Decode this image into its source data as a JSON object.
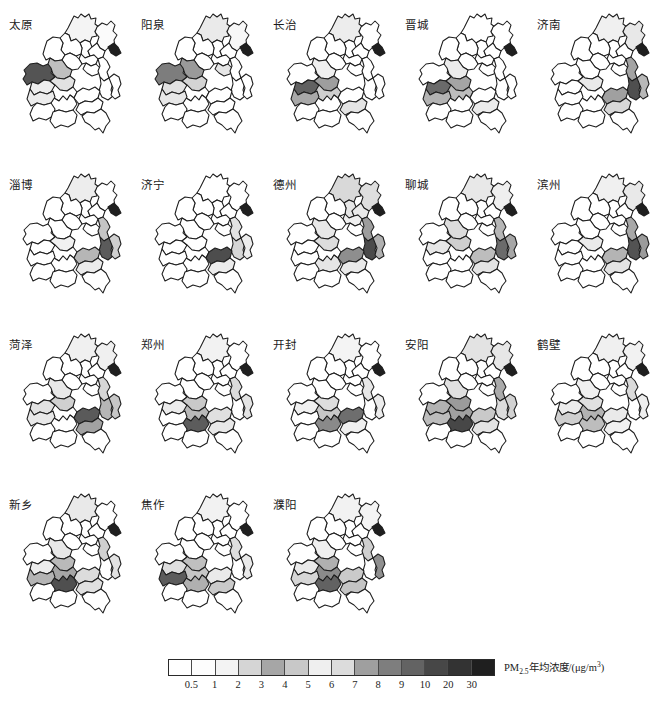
{
  "figure": {
    "kind": "small-multiples-choropleth-map-grid",
    "rows": 4,
    "columns": 5,
    "panel_count": 18
  },
  "panels": [
    {
      "title": "太原",
      "fills": [
        "#f4f4f4",
        "#fbfbfb",
        "#ffffff",
        "#ffffff",
        "#ffffff",
        "#ffffff",
        "#ffffff",
        "#ffffff",
        "#545454",
        "#bfbfbf",
        "#ffffff",
        "#ffffff",
        "#ffffff",
        "#ffffff",
        "#1f1f1f",
        "#ededed",
        "#e2e2e2",
        "#ffffff",
        "#ffffff",
        "#ffffff",
        "#ececec",
        "#ffffff",
        "#ffffff",
        "#ffffff",
        "#ffffff"
      ]
    },
    {
      "title": "阳泉",
      "fills": [
        "#eaeaea",
        "#f7f7f7",
        "#ffffff",
        "#ffffff",
        "#ffffff",
        "#ffffff",
        "#ffffff",
        "#ffffff",
        "#7d7d7d",
        "#9a9a9a",
        "#e6e6e6",
        "#ffffff",
        "#ffffff",
        "#ffffff",
        "#1f1f1f",
        "#e2e2e2",
        "#d4d4d4",
        "#ffffff",
        "#ffffff",
        "#ffffff",
        "#e7e7e7",
        "#ffffff",
        "#ffffff",
        "#ffffff",
        "#ffffff"
      ]
    },
    {
      "title": "长治",
      "fills": [
        "#ededed",
        "#ffffff",
        "#ffffff",
        "#ffffff",
        "#ffffff",
        "#ffffff",
        "#ffffff",
        "#ffffff",
        "#ffffff",
        "#efefef",
        "#ffffff",
        "#ffffff",
        "#ffffff",
        "#ffffff",
        "#1f1f1f",
        "#616161",
        "#9e9e9e",
        "#cfcfcf",
        "#ffffff",
        "#ffffff",
        "#a8a8a8",
        "#e4e4e4",
        "#ffffff",
        "#ffffff",
        "#ffffff"
      ]
    },
    {
      "title": "晋城",
      "fills": [
        "#ffffff",
        "#ffffff",
        "#ffffff",
        "#ffffff",
        "#ffffff",
        "#ffffff",
        "#ffffff",
        "#ffffff",
        "#ffffff",
        "#ebebeb",
        "#ffffff",
        "#ffffff",
        "#ffffff",
        "#ffffff",
        "#1f1f1f",
        "#6a6a6a",
        "#a5a5a5",
        "#bdbdbd",
        "#ffffff",
        "#ffffff",
        "#b3b3b3",
        "#ebebeb",
        "#ffffff",
        "#ffffff",
        "#ffffff"
      ]
    },
    {
      "title": "济南",
      "fills": [
        "#f0f0f0",
        "#e8e8e8",
        "#ffffff",
        "#ffffff",
        "#ffffff",
        "#ffffff",
        "#ffffff",
        "#ffffff",
        "#ffffff",
        "#ffffff",
        "#ffffff",
        "#a3a3a3",
        "#4f4f4f",
        "#b8b8b8",
        "#1f1f1f",
        "#ffffff",
        "#e9e9e9",
        "#ffffff",
        "#ffffff",
        "#a0a0a0",
        "#ffffff",
        "#d8d8d8",
        "#ffffff",
        "#ffffff",
        "#ffffff"
      ]
    },
    {
      "title": "淄博",
      "fills": [
        "#ededed",
        "#ffffff",
        "#ffffff",
        "#ffffff",
        "#ffffff",
        "#ffffff",
        "#ffffff",
        "#ffffff",
        "#ffffff",
        "#ffffff",
        "#ffffff",
        "#c4c4c4",
        "#5b5b5b",
        "#cfcfcf",
        "#1f1f1f",
        "#ffffff",
        "#f1f1f1",
        "#ffffff",
        "#ffffff",
        "#b6b6b6",
        "#ffffff",
        "#ebebeb",
        "#ffffff",
        "#ffffff",
        "#ffffff"
      ]
    },
    {
      "title": "济宁",
      "fills": [
        "#ffffff",
        "#ffffff",
        "#ffffff",
        "#ffffff",
        "#ffffff",
        "#ffffff",
        "#ffffff",
        "#ffffff",
        "#ffffff",
        "#ffffff",
        "#ffffff",
        "#e3e3e3",
        "#d6d6d6",
        "#ededed",
        "#1f1f1f",
        "#ffffff",
        "#ffffff",
        "#ffffff",
        "#ffffff",
        "#4d4d4d",
        "#ffffff",
        "#ececec",
        "#ffffff",
        "#ffffff",
        "#ffffff"
      ]
    },
    {
      "title": "德州",
      "fills": [
        "#d9d9d9",
        "#dedede",
        "#e6e6e6",
        "#eaeaea",
        "#ffffff",
        "#f0f0f0",
        "#ffffff",
        "#ffffff",
        "#ffffff",
        "#e8e8e8",
        "#ffffff",
        "#9d9d9d",
        "#4a4a4a",
        "#b0b0b0",
        "#1f1f1f",
        "#ffffff",
        "#dcdcdc",
        "#ffffff",
        "#e6e6e6",
        "#8e8e8e",
        "#ffffff",
        "#e9e9e9",
        "#ffffff",
        "#ffffff",
        "#ffffff"
      ]
    },
    {
      "title": "聊城",
      "fills": [
        "#e8e8e8",
        "#efefef",
        "#ffffff",
        "#ffffff",
        "#ffffff",
        "#ffffff",
        "#ffffff",
        "#ffffff",
        "#ffffff",
        "#dcdcdc",
        "#ffffff",
        "#b6b6b6",
        "#6b6b6b",
        "#a6a6a6",
        "#1f1f1f",
        "#e7e7e7",
        "#cfcfcf",
        "#ffffff",
        "#ffffff",
        "#bdbdbd",
        "#ffffff",
        "#e4e4e4",
        "#ffffff",
        "#ffffff",
        "#ffffff"
      ]
    },
    {
      "title": "滨州",
      "fills": [
        "#f0f0f0",
        "#e9e9e9",
        "#ffffff",
        "#ffffff",
        "#ffffff",
        "#ffffff",
        "#ffffff",
        "#ffffff",
        "#ffffff",
        "#ffffff",
        "#ffffff",
        "#a8a8a8",
        "#535353",
        "#9b9b9b",
        "#1f1f1f",
        "#ffffff",
        "#eaeaea",
        "#ffffff",
        "#ffffff",
        "#b4b4b4",
        "#ffffff",
        "#e3e3e3",
        "#ffffff",
        "#ffffff",
        "#ffffff"
      ]
    },
    {
      "title": "菏泽",
      "fills": [
        "#f0f0f0",
        "#f0f0f0",
        "#ffffff",
        "#ffffff",
        "#ffffff",
        "#ffffff",
        "#ffffff",
        "#ffffff",
        "#ffffff",
        "#e8e8e8",
        "#ffffff",
        "#d6d6d6",
        "#b6b6b6",
        "#c6c6c6",
        "#1f1f1f",
        "#e2e2e2",
        "#d0d0d0",
        "#ffffff",
        "#ffffff",
        "#5a5a5a",
        "#e8e8e8",
        "#a2a2a2",
        "#ffffff",
        "#ffffff",
        "#ffffff"
      ]
    },
    {
      "title": "郑州",
      "fills": [
        "#f2f2f2",
        "#ffffff",
        "#ffffff",
        "#ffffff",
        "#ffffff",
        "#ffffff",
        "#ffffff",
        "#ffffff",
        "#ffffff",
        "#ffffff",
        "#ffffff",
        "#dcdcdc",
        "#ffffff",
        "#e4e4e4",
        "#1f1f1f",
        "#ececec",
        "#c9c9c9",
        "#b9b9b9",
        "#5c5c5c",
        "#e0e0e0",
        "#ffffff",
        "#e8e8e8",
        "#ffffff",
        "#ffffff",
        "#ffffff"
      ]
    },
    {
      "title": "开封",
      "fills": [
        "#f4f4f4",
        "#ffffff",
        "#ffffff",
        "#ffffff",
        "#ffffff",
        "#ffffff",
        "#ffffff",
        "#ffffff",
        "#ffffff",
        "#ffffff",
        "#ffffff",
        "#e7e7e7",
        "#ffffff",
        "#ececec",
        "#1f1f1f",
        "#f0f0f0",
        "#dddddd",
        "#c8c8c8",
        "#8a8a8a",
        "#6e6e6e",
        "#ffffff",
        "#efefef",
        "#ffffff",
        "#ffffff",
        "#ffffff"
      ]
    },
    {
      "title": "安阳",
      "fills": [
        "#e3e3e3",
        "#e7e7e7",
        "#ffffff",
        "#ffffff",
        "#ffffff",
        "#ffffff",
        "#ffffff",
        "#ffffff",
        "#ffffff",
        "#e0e0e0",
        "#ffffff",
        "#ababab",
        "#dcdcdc",
        "#d2d2d2",
        "#1f1f1f",
        "#b2b2b2",
        "#9b9b9b",
        "#a0a0a0",
        "#474747",
        "#c9c9c9",
        "#bcbcbc",
        "#e4e4e4",
        "#ffffff",
        "#ffffff",
        "#ffffff"
      ]
    },
    {
      "title": "鹤壁",
      "fills": [
        "#f0f0f0",
        "#f2f2f2",
        "#ffffff",
        "#ffffff",
        "#ffffff",
        "#ffffff",
        "#ffffff",
        "#ffffff",
        "#ffffff",
        "#f0f0f0",
        "#ffffff",
        "#dbdbdb",
        "#ffffff",
        "#eeeeee",
        "#1f1f1f",
        "#ececec",
        "#e0e0e0",
        "#b3b3b3",
        "#bdbdbd",
        "#eaeaea",
        "#cfcfcf",
        "#f0f0f0",
        "#ffffff",
        "#ffffff",
        "#ffffff"
      ]
    },
    {
      "title": "新乡",
      "fills": [
        "#e9e9e9",
        "#ffffff",
        "#ffffff",
        "#ffffff",
        "#ffffff",
        "#ffffff",
        "#ffffff",
        "#ffffff",
        "#ffffff",
        "#e8e8e8",
        "#ffffff",
        "#d0d0d0",
        "#ffffff",
        "#e2e2e2",
        "#1f1f1f",
        "#ededed",
        "#bababa",
        "#a6a6a6",
        "#4f4f4f",
        "#dcdcdc",
        "#b4b4b4",
        "#e0e0e0",
        "#ffffff",
        "#ffffff",
        "#ffffff"
      ]
    },
    {
      "title": "焦作",
      "fills": [
        "#f2f2f2",
        "#ffffff",
        "#ffffff",
        "#ffffff",
        "#ffffff",
        "#ffffff",
        "#ffffff",
        "#ffffff",
        "#ffffff",
        "#ffffff",
        "#ffffff",
        "#dddddd",
        "#ffffff",
        "#eaeaea",
        "#1f1f1f",
        "#dfdfdf",
        "#c0c0c0",
        "#c6c6c6",
        "#b0b0b0",
        "#eaeaea",
        "#5c5c5c",
        "#cacaca",
        "#ffffff",
        "#ffffff",
        "#ffffff"
      ]
    },
    {
      "title": "濮阳",
      "fills": [
        "#f2f2f2",
        "#f4f4f4",
        "#ffffff",
        "#ffffff",
        "#ffffff",
        "#ffffff",
        "#ffffff",
        "#ffffff",
        "#ffffff",
        "#efefef",
        "#ffffff",
        "#cfcfcf",
        "#ffffff",
        "#8f8f8f",
        "#1f1f1f",
        "#eaeaea",
        "#b0b0b0",
        "#8b8b8b",
        "#626262",
        "#cacaca",
        "#d6d6d6",
        "#c4c4c4",
        "#ffffff",
        "#ffffff",
        "#ffffff"
      ]
    }
  ],
  "legend": {
    "label": "PM",
    "label_sub": "2.5",
    "label_rest": "年均浓度/(μg/m",
    "label_sup": "3",
    "label_end": ")",
    "swatch_color": "#1f1f1f",
    "ticks": [
      "0.5",
      "1",
      "2",
      "3",
      "4",
      "5",
      "6",
      "7",
      "8",
      "9",
      "10",
      "20",
      "30"
    ],
    "cells": [
      "#ffffff",
      "#fdfdfd",
      "#f3f3f3",
      "#d5d5d5",
      "#a6a6a6",
      "#c8c8c8",
      "#efefef",
      "#dcdcdc",
      "#9f9f9f",
      "#7e7e7e",
      "#636363",
      "#474747",
      "#333333",
      "#1f1f1f"
    ]
  },
  "chart_data": {
    "type": "heatmap",
    "title": "",
    "xlabel": "",
    "ylabel": "",
    "legend_title": "PM2.5年均浓度/(μg/m³)",
    "legend_breaks": [
      0.5,
      1,
      2,
      3,
      4,
      5,
      6,
      7,
      8,
      9,
      10,
      20,
      30
    ],
    "panel_titles": [
      "太原",
      "阳泉",
      "长治",
      "晋城",
      "济南",
      "淄博",
      "济宁",
      "德州",
      "聊城",
      "滨州",
      "菏泽",
      "郑州",
      "开封",
      "安阳",
      "鹤壁",
      "新乡",
      "焦作",
      "濮阳"
    ],
    "region_count_per_panel": 25,
    "series": [
      {
        "name": "太原",
        "values": [
          1.1,
          0.7,
          0.2,
          0.2,
          0.2,
          0.2,
          0.2,
          0.2,
          20,
          6,
          0.2,
          0.2,
          0.2,
          0.2,
          35,
          1.5,
          2.2,
          0.2,
          0.2,
          0.2,
          1.6,
          0.2,
          0.2,
          0.2,
          0.2
        ]
      },
      {
        "name": "阳泉",
        "values": [
          1.8,
          0.9,
          0.2,
          0.2,
          0.2,
          0.2,
          0.2,
          0.2,
          9,
          8,
          2.0,
          0.2,
          0.2,
          0.2,
          35,
          2.2,
          3.0,
          0.2,
          0.2,
          0.2,
          1.9,
          0.2,
          0.2,
          0.2,
          0.2
        ]
      },
      {
        "name": "长治",
        "values": [
          1.5,
          0.2,
          0.2,
          0.2,
          0.2,
          0.2,
          0.2,
          0.2,
          0.2,
          1.3,
          0.2,
          0.2,
          0.2,
          0.2,
          35,
          20,
          8,
          4.5,
          0.2,
          0.2,
          7,
          2.0,
          0.2,
          0.2,
          0.2
        ]
      },
      {
        "name": "晋城",
        "values": [
          0.2,
          0.2,
          0.2,
          0.2,
          0.2,
          0.2,
          0.2,
          0.2,
          0.2,
          1.4,
          0.2,
          0.2,
          0.2,
          0.2,
          35,
          18,
          7,
          5.5,
          0.2,
          0.2,
          6,
          1.4,
          0.2,
          0.2,
          0.2
        ]
      },
      {
        "name": "济南",
        "values": [
          1.2,
          1.7,
          0.2,
          0.2,
          0.2,
          0.2,
          0.2,
          0.2,
          0.2,
          0.2,
          0.2,
          7,
          22,
          5,
          35,
          0.2,
          1.6,
          0.2,
          0.2,
          8,
          0.2,
          3.5,
          0.2,
          0.2,
          0.2
        ]
      },
      {
        "name": "淄博",
        "values": [
          1.5,
          0.2,
          0.2,
          0.2,
          0.2,
          0.2,
          0.2,
          0.2,
          0.2,
          0.2,
          0.2,
          4.5,
          19,
          4.0,
          35,
          0.2,
          1.0,
          0.2,
          0.2,
          6.5,
          0.2,
          1.4,
          0.2,
          0.2,
          0.2
        ]
      },
      {
        "name": "济宁",
        "values": [
          0.2,
          0.2,
          0.2,
          0.2,
          0.2,
          0.2,
          0.2,
          0.2,
          0.2,
          0.2,
          0.2,
          2.0,
          3.2,
          1.5,
          35,
          0.2,
          0.2,
          0.2,
          0.2,
          23,
          0.2,
          1.4,
          0.2,
          0.2,
          0.2
        ]
      },
      {
        "name": "德州",
        "values": [
          3.8,
          3.4,
          3.0,
          2.6,
          0.2,
          2.2,
          0.2,
          0.2,
          0.2,
          1.8,
          0.2,
          7.5,
          24,
          6,
          35,
          0.2,
          3.2,
          0.2,
          3.0,
          9,
          0.2,
          1.5,
          0.2,
          0.2,
          0.2
        ]
      },
      {
        "name": "聊城",
        "values": [
          1.8,
          1.3,
          0.2,
          0.2,
          0.2,
          0.2,
          0.2,
          0.2,
          0.2,
          3.2,
          0.2,
          5.5,
          16,
          7.5,
          35,
          1.9,
          4.2,
          0.2,
          0.2,
          5.0,
          0.2,
          2.0,
          0.2,
          0.2,
          0.2
        ]
      },
      {
        "name": "滨州",
        "values": [
          1.2,
          1.6,
          0.2,
          0.2,
          0.2,
          0.2,
          0.2,
          0.2,
          0.2,
          0.2,
          0.2,
          7,
          21,
          8.5,
          35,
          0.2,
          1.7,
          0.2,
          0.2,
          6,
          0.2,
          2.4,
          0.2,
          0.2,
          0.2
        ]
      },
      {
        "name": "菏泽",
        "values": [
          1.2,
          1.2,
          0.2,
          0.2,
          0.2,
          0.2,
          0.2,
          0.2,
          0.2,
          1.8,
          0.2,
          3.5,
          7.5,
          4.5,
          35,
          2.2,
          4.8,
          0.2,
          0.2,
          19,
          1.8,
          8,
          0.2,
          0.2,
          0.2
        ]
      },
      {
        "name": "郑州",
        "values": [
          1.0,
          0.2,
          0.2,
          0.2,
          0.2,
          0.2,
          0.2,
          0.2,
          0.2,
          0.2,
          0.2,
          2.0,
          0.2,
          1.6,
          35,
          1.4,
          5.5,
          6.5,
          18,
          1.8,
          0.2,
          1.5,
          0.2,
          0.2,
          0.2
        ]
      },
      {
        "name": "开封",
        "values": [
          0.9,
          0.2,
          0.2,
          0.2,
          0.2,
          0.2,
          0.2,
          0.2,
          0.2,
          0.2,
          0.2,
          1.5,
          0.2,
          1.4,
          35,
          1.2,
          2.3,
          5.0,
          10,
          16,
          0.2,
          1.2,
          0.2,
          0.2,
          0.2
        ]
      },
      {
        "name": "安阳",
        "values": [
          2.4,
          2.0,
          0.2,
          0.2,
          0.2,
          0.2,
          0.2,
          0.2,
          0.2,
          2.5,
          0.2,
          8.5,
          2.2,
          3.8,
          35,
          7.5,
          9,
          8.5,
          26,
          4.5,
          6,
          2.0,
          0.2,
          0.2,
          0.2
        ]
      },
      {
        "name": "鹤壁",
        "values": [
          1.2,
          1.0,
          0.2,
          0.2,
          0.2,
          0.2,
          0.2,
          0.2,
          0.2,
          1.2,
          0.2,
          2.4,
          0.2,
          1.3,
          35,
          1.4,
          1.9,
          6.5,
          5.5,
          1.6,
          4.0,
          1.2,
          0.2,
          0.2,
          0.2
        ]
      },
      {
        "name": "新乡",
        "values": [
          1.7,
          0.2,
          0.2,
          0.2,
          0.2,
          0.2,
          0.2,
          0.2,
          0.2,
          1.8,
          0.2,
          4.5,
          0.2,
          2.2,
          35,
          1.5,
          6.5,
          8,
          22,
          2.6,
          6.5,
          2.0,
          0.2,
          0.2,
          0.2
        ]
      },
      {
        "name": "焦作",
        "values": [
          1.0,
          0.2,
          0.2,
          0.2,
          0.2,
          0.2,
          0.2,
          0.2,
          0.2,
          0.2,
          0.2,
          2.2,
          0.2,
          1.4,
          35,
          2.1,
          5.5,
          5.0,
          7,
          1.4,
          18,
          4.2,
          0.2,
          0.2,
          0.2
        ]
      },
      {
        "name": "濮阳",
        "values": [
          1.0,
          0.9,
          0.2,
          0.2,
          0.2,
          0.2,
          0.2,
          0.2,
          0.2,
          1.3,
          0.2,
          3.6,
          0.2,
          10,
          35,
          1.6,
          7,
          11,
          15,
          4.2,
          3.4,
          5.0,
          0.2,
          0.2,
          0.2
        ]
      }
    ]
  }
}
